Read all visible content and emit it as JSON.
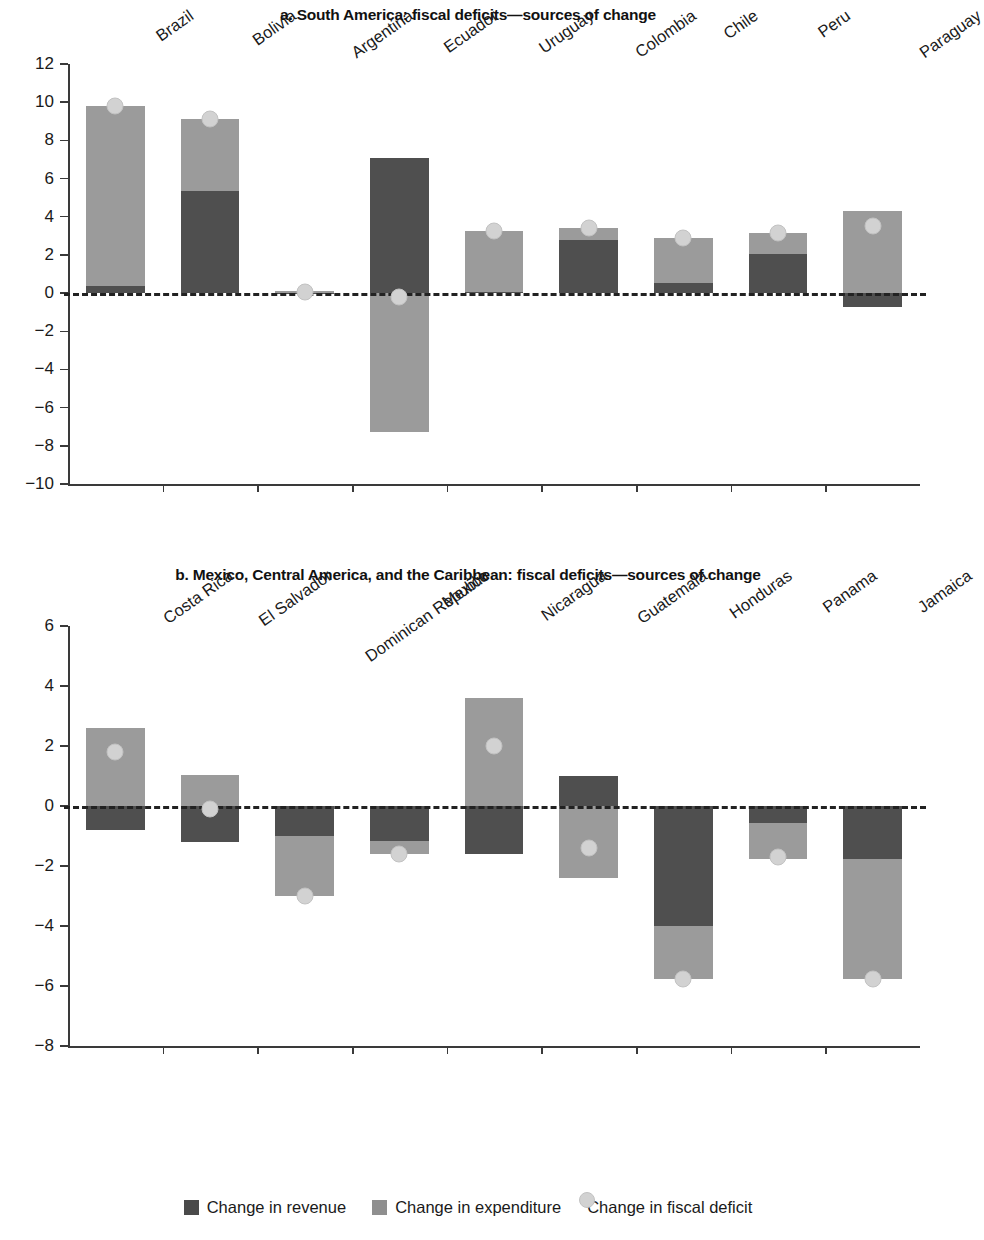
{
  "figure": {
    "legend": [
      {
        "key": "revenue",
        "label": "Change in revenue",
        "swatch": "square",
        "color": "#4a4a4a"
      },
      {
        "key": "expenditure",
        "label": "Change in expenditure",
        "swatch": "square",
        "color": "#8f8f8f"
      },
      {
        "key": "deficit",
        "label": "Change in fiscal deficit",
        "swatch": "circle",
        "color": "#d2d2d2"
      }
    ]
  },
  "chart_data": [
    {
      "type": "bar",
      "id": "panel-a",
      "title": "a. South America: fiscal deficits—sources of change",
      "xlabel": "",
      "ylabel": "",
      "ylim": [
        -10,
        12
      ],
      "yticks": [
        12,
        10,
        8,
        6,
        4,
        2,
        0,
        -2,
        -4,
        -6,
        -8,
        -10
      ],
      "ytick_labels": [
        "12",
        "10",
        "8",
        "6",
        "4",
        "2",
        "0",
        "−2",
        "−4",
        "−6",
        "−8",
        "−10"
      ],
      "grid": false,
      "zero_line": 0,
      "legend_position": "below-figure",
      "categories": [
        "Brazil",
        "Bolivia",
        "Argentina",
        "Ecuador",
        "Uruguay",
        "Colombia",
        "Chile",
        "Peru",
        "Paraguay"
      ],
      "series": [
        {
          "name": "Change in revenue",
          "color": "#4f4f4f",
          "values": [
            0.35,
            5.35,
            -0.05,
            7.1,
            0.05,
            2.8,
            0.55,
            2.05,
            -0.75
          ]
        },
        {
          "name": "Change in expenditure",
          "color": "#9b9b9b",
          "values": [
            9.45,
            3.75,
            0.1,
            -7.3,
            3.2,
            0.6,
            2.35,
            1.1,
            4.3
          ]
        }
      ],
      "markers": {
        "name": "Change in fiscal deficit",
        "color": "#d2d2d2",
        "values": [
          9.8,
          9.1,
          0.05,
          -0.2,
          3.25,
          3.4,
          2.9,
          3.15,
          3.5
        ]
      }
    },
    {
      "type": "bar",
      "id": "panel-b",
      "title": "b. Mexico, Central America, and the Caribbean:  fiscal deficits—sources of change",
      "xlabel": "",
      "ylabel": "",
      "ylim": [
        -8,
        6
      ],
      "yticks": [
        6,
        4,
        2,
        0,
        -2,
        -4,
        -6,
        -8
      ],
      "ytick_labels": [
        "6",
        "4",
        "2",
        "0",
        "−2",
        "−4",
        "−6",
        "−8"
      ],
      "grid": false,
      "zero_line": 0,
      "legend_position": "below-figure",
      "categories": [
        "Costa Rica",
        "El Salvador",
        "Dominican Republic",
        "Mexico",
        "Nicaragua",
        "Guatemala",
        "Honduras",
        "Panama",
        "Jamaica"
      ],
      "series": [
        {
          "name": "Change in revenue",
          "color": "#4f4f4f",
          "values": [
            -0.8,
            -1.2,
            -1.0,
            -1.15,
            -1.6,
            1.0,
            -4.0,
            -0.55,
            -1.75
          ]
        },
        {
          "name": "Change in expenditure",
          "color": "#9b9b9b",
          "values": [
            2.6,
            1.05,
            -2.0,
            -0.45,
            3.6,
            -2.4,
            -1.75,
            -1.2,
            -4.0
          ]
        }
      ],
      "markers": {
        "name": "Change in fiscal deficit",
        "color": "#d2d2d2",
        "values": [
          1.8,
          -0.1,
          -3.0,
          -1.6,
          2.0,
          -1.4,
          -5.75,
          -1.7,
          -5.75
        ]
      }
    }
  ]
}
